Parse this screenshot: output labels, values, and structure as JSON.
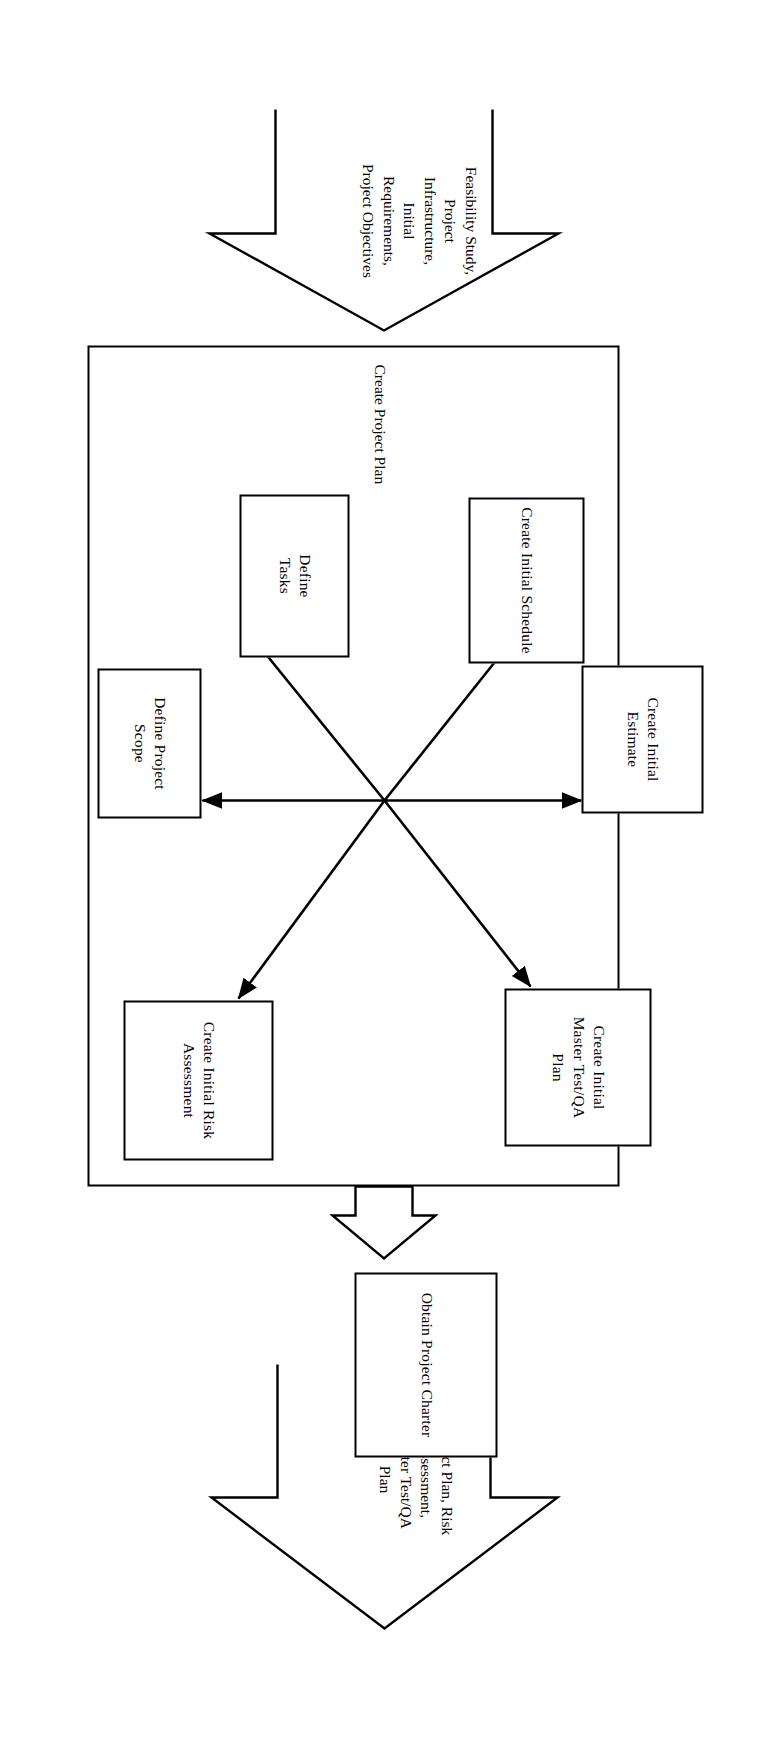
{
  "diagram": {
    "title": "Create Project Plan",
    "type": "process-flow",
    "orientation": "rotated-90-clockwise",
    "colors": {
      "stroke": "#000000",
      "background": "#ffffff",
      "text": "#000000"
    },
    "input_arrow": {
      "name": "input-arrow",
      "label": "Feasibility Study,\nProject\nInfrastructure,\nInitial\nRequirements,\nProject Objectives",
      "lines": [
        "Feasibility Study,",
        "Project",
        "Infrastructure,",
        "Initial",
        "Requirements,",
        "Project Objectives"
      ]
    },
    "output_arrow": {
      "name": "output-arrow",
      "label": "Project Plan, Risk\nAssessment,\nMaster Test/QA\nPlan",
      "lines": [
        "Project Plan, Risk",
        "Assessment,",
        "Master Test/QA",
        "Plan"
      ]
    },
    "connector_arrow": {
      "name": "connector-arrow",
      "label": ""
    },
    "group": {
      "name": "create-project-plan-group",
      "label": "Create Project Plan"
    },
    "nodes": [
      {
        "id": "define-project-scope",
        "label": "Define Project Scope"
      },
      {
        "id": "define-tasks",
        "label": "Define\nTasks"
      },
      {
        "id": "create-initial-schedule",
        "label": "Create Initial Schedule"
      },
      {
        "id": "create-initial-estimate",
        "label": "Create Initial Estimate"
      },
      {
        "id": "create-initial-master-test-qa-plan",
        "label": "Create Initial\nMaster Test/QA\nPlan"
      },
      {
        "id": "create-initial-risk-assessment",
        "label": "Create Initial Risk\nAssessment"
      },
      {
        "id": "obtain-project-charter",
        "label": "Obtain Project Charter"
      }
    ],
    "edges": [
      {
        "from": "hub",
        "to": "define-project-scope"
      },
      {
        "from": "hub",
        "to": "define-tasks"
      },
      {
        "from": "hub",
        "to": "create-initial-schedule"
      },
      {
        "from": "hub",
        "to": "create-initial-estimate"
      },
      {
        "from": "hub",
        "to": "create-initial-master-test-qa-plan"
      },
      {
        "from": "hub",
        "to": "create-initial-risk-assessment"
      }
    ]
  }
}
